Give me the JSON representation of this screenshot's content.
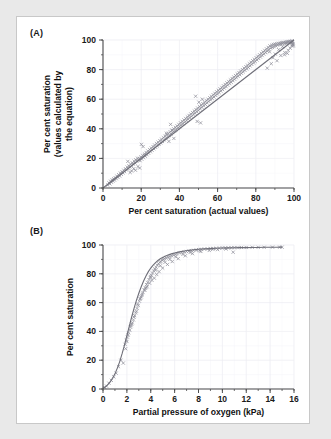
{
  "figure": {
    "panel_a_label": "(A)",
    "panel_b_label": "(B)"
  },
  "chart_data": [
    {
      "id": "panel-a",
      "type": "scatter",
      "title": "",
      "panel_label": "(A)",
      "xlabel": "Per cent saturation (actual values)",
      "ylabel": "Per cent saturation (values calculated by the equation)",
      "ylabel_lines": [
        "Per cent saturation",
        "(values calculated by",
        "the equation)"
      ],
      "xlim": [
        0,
        100
      ],
      "ylim": [
        0,
        100
      ],
      "xticks": [
        0,
        20,
        40,
        60,
        80,
        100
      ],
      "yticks": [
        0,
        20,
        40,
        60,
        80,
        100
      ],
      "xtick_labels": [
        "0",
        "20",
        "40",
        "60",
        "80",
        "100"
      ],
      "ytick_labels": [
        "0",
        "20",
        "40",
        "60",
        "80",
        "100"
      ],
      "minor_tick_step": 10,
      "grid": true,
      "legend": "none",
      "marker": "cross",
      "marker_color": "#8f8f99",
      "line_color": "#6e6e78",
      "fit_line": {
        "type": "linear",
        "slope": 1.0,
        "intercept": 0.0,
        "x": [
          0,
          100
        ],
        "y": [
          0,
          100
        ]
      },
      "x": [
        2.5,
        3.1,
        3.6,
        4.0,
        4.4,
        4.8,
        5.2,
        5.6,
        6.0,
        6.4,
        6.9,
        7.3,
        7.8,
        8.2,
        8.7,
        9.1,
        9.6,
        10.0,
        10.4,
        10.9,
        11.3,
        11.8,
        12.2,
        12.7,
        13.1,
        13.6,
        14.0,
        14.5,
        14.9,
        15.4,
        15.8,
        16.3,
        16.7,
        17.2,
        17.6,
        18.1,
        18.5,
        19.0,
        19.4,
        19.9,
        20.3,
        20.8,
        21.2,
        21.7,
        22.1,
        22.6,
        23.0,
        23.5,
        23.9,
        24.4,
        24.8,
        25.3,
        25.7,
        26.2,
        26.6,
        27.1,
        27.5,
        28.0,
        28.4,
        28.9,
        29.3,
        29.8,
        30.2,
        30.7,
        31.1,
        31.6,
        32.0,
        32.5,
        32.9,
        33.4,
        33.8,
        34.3,
        34.7,
        35.2,
        35.6,
        36.1,
        36.5,
        37.0,
        37.4,
        37.9,
        38.3,
        38.8,
        39.2,
        39.7,
        40.1,
        40.6,
        41.0,
        41.5,
        41.9,
        42.4,
        42.8,
        43.3,
        43.7,
        44.2,
        44.6,
        45.1,
        45.5,
        46.0,
        46.4,
        46.9,
        47.3,
        47.8,
        48.2,
        48.7,
        49.1,
        49.6,
        50.0,
        50.5,
        50.9,
        51.4,
        51.8,
        52.3,
        52.7,
        53.2,
        53.6,
        54.1,
        54.5,
        55.0,
        55.4,
        55.9,
        56.3,
        56.8,
        57.2,
        57.7,
        58.1,
        58.6,
        59.0,
        59.5,
        59.9,
        60.4,
        60.8,
        61.3,
        61.7,
        62.2,
        62.6,
        63.1,
        63.5,
        64.0,
        64.4,
        64.9,
        65.3,
        65.8,
        66.2,
        66.7,
        67.1,
        67.6,
        68.0,
        68.5,
        68.9,
        69.4,
        69.8,
        70.3,
        70.7,
        71.2,
        71.6,
        72.1,
        72.5,
        73.0,
        73.4,
        73.9,
        74.3,
        74.8,
        75.2,
        75.7,
        76.1,
        76.6,
        77.0,
        77.5,
        77.9,
        78.4,
        78.8,
        79.3,
        79.7,
        80.2,
        80.6,
        81.1,
        81.5,
        82.0,
        82.4,
        82.9,
        83.3,
        83.8,
        84.2,
        84.7,
        85.1,
        85.6,
        86.0,
        86.5,
        86.9,
        87.4,
        87.8,
        88.3,
        88.7,
        89.2,
        89.6,
        90.1,
        90.5,
        91.0,
        91.4,
        91.9,
        92.3,
        92.8,
        93.2,
        93.7,
        94.1,
        94.6,
        95.0,
        95.5,
        95.9,
        96.4,
        96.8,
        97.3,
        97.7,
        98.2,
        98.6,
        99.0,
        99.2,
        99.4,
        99.5,
        99.6,
        13.0,
        14.2,
        15.0,
        16.1,
        17.0,
        18.3,
        19.2,
        20.1,
        21.0,
        21.8,
        33.2,
        34.5,
        35.4,
        36.2,
        37.1,
        48.5,
        49.3,
        50.2,
        51.1,
        52.0,
        86.0,
        87.2,
        88.1,
        89.0,
        90.2,
        91.1,
        92.0,
        93.1,
        94.0,
        95.2,
        96.1,
        97.0,
        97.5,
        98.0,
        98.4,
        98.8,
        99.1,
        99.3,
        96.5,
        95.0
      ],
      "y": [
        2.0,
        3.5,
        2.8,
        4.6,
        3.9,
        5.5,
        4.7,
        6.2,
        5.4,
        7.0,
        6.3,
        8.0,
        7.2,
        9.0,
        8.1,
        10.1,
        9.2,
        11.0,
        10.2,
        12.0,
        11.1,
        13.0,
        12.2,
        14.1,
        13.1,
        15.0,
        14.2,
        16.1,
        15.0,
        17.0,
        16.2,
        18.1,
        17.0,
        19.0,
        18.2,
        20.1,
        19.0,
        20.0,
        18.5,
        21.0,
        19.5,
        22.0,
        20.5,
        23.0,
        21.5,
        24.0,
        22.5,
        25.0,
        23.5,
        26.0,
        24.5,
        27.0,
        25.5,
        28.0,
        26.5,
        29.0,
        27.5,
        30.0,
        28.5,
        31.0,
        29.5,
        32.0,
        30.5,
        33.0,
        31.5,
        34.0,
        32.5,
        35.0,
        33.5,
        36.0,
        34.5,
        37.0,
        35.5,
        38.0,
        36.5,
        39.0,
        37.5,
        40.0,
        38.5,
        41.0,
        39.5,
        42.0,
        40.5,
        43.0,
        41.5,
        44.0,
        42.5,
        45.0,
        43.5,
        46.0,
        44.5,
        47.0,
        45.5,
        48.0,
        46.5,
        49.0,
        47.5,
        50.0,
        48.5,
        51.0,
        49.5,
        52.0,
        50.5,
        53.0,
        51.5,
        54.0,
        52.5,
        55.0,
        53.5,
        56.0,
        54.5,
        57.0,
        55.5,
        58.0,
        56.5,
        59.0,
        57.5,
        60.0,
        58.5,
        61.0,
        59.5,
        62.0,
        60.5,
        63.0,
        61.5,
        64.0,
        62.5,
        65.0,
        63.5,
        66.0,
        64.5,
        67.0,
        65.5,
        68.0,
        66.5,
        69.0,
        67.5,
        70.0,
        68.5,
        71.0,
        69.5,
        72.0,
        70.5,
        73.0,
        71.5,
        74.0,
        72.5,
        75.0,
        73.5,
        76.0,
        74.5,
        77.0,
        75.5,
        78.0,
        76.5,
        79.0,
        77.5,
        80.0,
        78.5,
        81.0,
        79.5,
        82.0,
        80.5,
        83.0,
        81.5,
        84.0,
        82.5,
        85.0,
        83.5,
        86.0,
        84.5,
        87.0,
        85.5,
        88.0,
        86.5,
        89.0,
        87.5,
        90.0,
        88.5,
        91.0,
        89.5,
        92.0,
        90.5,
        93.0,
        91.5,
        94.0,
        92.5,
        95.0,
        93.5,
        96.0,
        94.5,
        96.5,
        95.0,
        97.0,
        95.5,
        97.2,
        96.0,
        97.5,
        96.5,
        97.8,
        97.0,
        98.0,
        97.3,
        98.2,
        97.6,
        98.4,
        97.9,
        98.6,
        98.1,
        98.8,
        98.3,
        99.0,
        98.5,
        99.1,
        98.7,
        99.2,
        98.0,
        97.5,
        96.8,
        96.0,
        18.0,
        10.5,
        11.5,
        13.0,
        12.0,
        14.5,
        13.5,
        29.5,
        28.0,
        22.0,
        37.0,
        31.5,
        43.0,
        39.0,
        33.5,
        62.0,
        45.0,
        58.0,
        44.0,
        60.0,
        81.0,
        92.0,
        84.0,
        88.0,
        90.5,
        86.0,
        93.5,
        89.5,
        95.5,
        91.5,
        97.5,
        93.0,
        98.5,
        94.5,
        99.0,
        96.0,
        99.3,
        97.0,
        91.0,
        90.0
      ]
    },
    {
      "id": "panel-b",
      "type": "scatter",
      "title": "",
      "panel_label": "(B)",
      "xlabel": "Partial pressure of oxygen (kPa)",
      "ylabel": "Per cent saturation",
      "ylabel_lines": [
        "Per cent saturation"
      ],
      "xlim": [
        0,
        16
      ],
      "ylim": [
        0,
        100
      ],
      "xticks": [
        0,
        2,
        4,
        6,
        8,
        10,
        12,
        14,
        16
      ],
      "yticks": [
        0,
        20,
        40,
        60,
        80,
        100
      ],
      "xtick_labels": [
        "0",
        "2",
        "4",
        "6",
        "8",
        "10",
        "12",
        "14",
        "16"
      ],
      "ytick_labels": [
        "0",
        "20",
        "40",
        "60",
        "80",
        "100"
      ],
      "minor_tick_step": 1,
      "grid": true,
      "legend": "none",
      "marker": "cross",
      "marker_color": "#8f8f99",
      "line_color": "#9a9aa4",
      "curve": {
        "type": "sigmoid",
        "x": [
          0.0,
          0.2,
          0.4,
          0.6,
          0.8,
          1.0,
          1.2,
          1.4,
          1.6,
          1.8,
          2.0,
          2.2,
          2.4,
          2.6,
          2.8,
          3.0,
          3.2,
          3.4,
          3.6,
          3.8,
          4.0,
          4.2,
          4.4,
          4.6,
          4.8,
          5.0,
          5.2,
          5.4,
          5.6,
          5.8,
          6.0,
          6.4,
          6.8,
          7.2,
          7.6,
          8.0,
          8.5,
          9.0,
          9.5,
          10.0,
          10.5,
          11.0,
          11.5,
          12.0,
          12.5,
          13.0,
          13.5,
          14.0,
          14.5,
          15.0
        ],
        "y": [
          0.5,
          1.5,
          3.0,
          5.0,
          7.5,
          10.5,
          14.5,
          19.0,
          24.5,
          30.5,
          37.0,
          43.5,
          50.0,
          56.0,
          61.5,
          66.5,
          71.0,
          75.0,
          78.5,
          81.5,
          84.0,
          86.0,
          87.8,
          89.2,
          90.4,
          91.4,
          92.2,
          92.9,
          93.5,
          94.0,
          94.5,
          95.2,
          95.8,
          96.3,
          96.7,
          97.0,
          97.3,
          97.5,
          97.7,
          97.9,
          98.0,
          98.1,
          98.2,
          98.2,
          98.3,
          98.3,
          98.4,
          98.4,
          98.4,
          98.5
        ]
      },
      "x": [
        0.15,
        0.3,
        0.5,
        0.7,
        0.9,
        1.1,
        1.3,
        1.5,
        1.7,
        1.85,
        1.95,
        2.05,
        2.15,
        2.25,
        2.35,
        2.45,
        2.55,
        2.65,
        2.75,
        2.85,
        2.95,
        3.05,
        3.15,
        3.25,
        3.35,
        3.45,
        3.55,
        3.65,
        3.75,
        3.85,
        3.95,
        4.05,
        4.15,
        4.25,
        4.35,
        4.45,
        4.55,
        4.65,
        4.75,
        4.85,
        4.95,
        5.05,
        5.15,
        5.3,
        5.45,
        5.6,
        5.75,
        5.9,
        6.05,
        6.2,
        6.4,
        6.6,
        6.8,
        7.0,
        7.2,
        7.4,
        7.6,
        7.8,
        8.0,
        8.25,
        8.5,
        8.75,
        9.0,
        9.25,
        9.5,
        9.75,
        10.0,
        10.25,
        10.5,
        10.75,
        11.0,
        11.3,
        11.6,
        12.0,
        12.5,
        13.0,
        13.5,
        14.2,
        14.8,
        15.0,
        1.9,
        2.1,
        2.3,
        2.6,
        2.9,
        3.1,
        3.3,
        3.5,
        3.7,
        3.9,
        4.1,
        4.3,
        4.5,
        4.7,
        5.0,
        5.4,
        5.8,
        6.3,
        6.9,
        7.5,
        8.2,
        8.9,
        9.6,
        10.3,
        10.9,
        2.0,
        2.4,
        2.8,
        3.2,
        3.6,
        4.0,
        4.4,
        4.8,
        5.2,
        5.6,
        6.1,
        6.7,
        7.3,
        8.1,
        9.2
      ],
      "y": [
        1.0,
        2.0,
        4.0,
        6.0,
        8.5,
        11.0,
        15.5,
        20.0,
        18.0,
        31.0,
        34.0,
        36.0,
        39.0,
        41.0,
        44.0,
        46.0,
        48.0,
        51.0,
        53.0,
        56.0,
        58.0,
        61.0,
        63.0,
        65.0,
        67.0,
        69.0,
        70.0,
        72.5,
        74.0,
        76.0,
        77.5,
        79.0,
        80.5,
        82.0,
        83.5,
        84.5,
        86.0,
        87.0,
        88.0,
        88.5,
        89.5,
        90.0,
        90.5,
        91.0,
        91.5,
        92.0,
        92.5,
        93.0,
        93.5,
        94.0,
        94.5,
        94.8,
        95.2,
        95.5,
        95.8,
        96.0,
        96.3,
        96.5,
        96.8,
        97.0,
        97.2,
        97.3,
        97.5,
        97.6,
        97.7,
        97.8,
        97.9,
        98.0,
        98.0,
        98.1,
        98.2,
        98.2,
        98.3,
        98.3,
        98.4,
        98.4,
        98.4,
        98.5,
        98.5,
        98.5,
        28.0,
        37.5,
        43.0,
        50.0,
        59.0,
        62.5,
        66.0,
        68.5,
        71.0,
        73.5,
        75.5,
        77.0,
        79.5,
        81.5,
        84.0,
        86.5,
        88.5,
        90.5,
        92.5,
        94.0,
        95.5,
        96.2,
        96.8,
        97.2,
        95.0,
        33.0,
        45.0,
        54.0,
        64.0,
        70.5,
        78.0,
        82.5,
        85.5,
        88.0,
        90.0,
        91.8,
        93.5,
        94.8,
        96.0,
        97.0
      ]
    }
  ]
}
